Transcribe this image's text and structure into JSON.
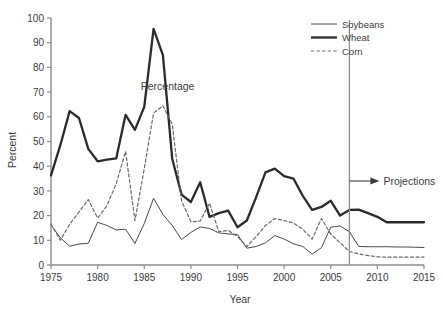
{
  "chart_data": {
    "type": "line",
    "title": "Percentage",
    "xlabel": "Year",
    "ylabel": "Percent",
    "xlim": [
      1975,
      2015
    ],
    "ylim": [
      0,
      100
    ],
    "xticks": [
      1975,
      1980,
      1985,
      1990,
      1995,
      2000,
      2005,
      2010,
      2015
    ],
    "yticks": [
      0,
      10,
      20,
      30,
      40,
      50,
      60,
      70,
      80,
      90,
      100
    ],
    "grid": false,
    "legend_position": "top-right",
    "legend": [
      "Soybeans",
      "Wheat",
      "Corn"
    ],
    "annotations": [
      {
        "text": "Percentage",
        "x": 1987.5,
        "y": 71
      },
      {
        "text": "Projections",
        "x": 2009.5,
        "y": 34
      }
    ],
    "projection_divider_year": 2007,
    "x": [
      1975,
      1976,
      1977,
      1978,
      1979,
      1980,
      1981,
      1982,
      1983,
      1984,
      1985,
      1986,
      1987,
      1988,
      1989,
      1990,
      1991,
      1992,
      1993,
      1994,
      1995,
      1996,
      1997,
      1998,
      1999,
      2000,
      2001,
      2002,
      2003,
      2004,
      2005,
      2006,
      2007,
      2008,
      2009,
      2010,
      2011,
      2012,
      2013,
      2014,
      2015
    ],
    "series": [
      {
        "name": "Soybeans",
        "style": "thin-solid",
        "color": "#4a4a4a",
        "values": [
          16.3,
          11.0,
          7.6,
          8.5,
          8.8,
          17.3,
          16.0,
          14.2,
          14.5,
          8.7,
          16.8,
          27.0,
          20.5,
          16.0,
          10.3,
          13.2,
          15.4,
          14.8,
          13.0,
          12.6,
          12.3,
          6.8,
          7.5,
          9.0,
          11.9,
          10.5,
          8.6,
          7.5,
          4.4,
          7.0,
          15.3,
          15.8,
          13.5,
          7.5,
          7.4,
          7.4,
          7.4,
          7.3,
          7.3,
          7.2,
          7.1
        ]
      },
      {
        "name": "Wheat",
        "style": "thick-solid",
        "color": "#2b2b2b",
        "values": [
          36.3,
          48.5,
          62.3,
          59.5,
          47.0,
          42.0,
          42.7,
          43.2,
          60.8,
          54.7,
          64.0,
          95.6,
          85.0,
          43.0,
          28.5,
          25.5,
          33.5,
          19.5,
          21.0,
          22.0,
          15.3,
          18.0,
          27.5,
          37.5,
          39.0,
          36.0,
          35.0,
          28.0,
          22.3,
          23.5,
          26.0,
          20.0,
          22.3,
          22.4,
          21.0,
          19.5,
          17.3,
          17.3,
          17.3,
          17.3,
          17.3
        ]
      },
      {
        "name": "Corn",
        "style": "dashed",
        "color": "#6a6a6a",
        "values": [
          16.6,
          10.0,
          16.5,
          21.5,
          26.5,
          19.0,
          24.0,
          33.0,
          46.0,
          18.0,
          39.0,
          61.5,
          64.5,
          57.0,
          26.0,
          17.5,
          17.8,
          25.0,
          13.5,
          14.0,
          11.5,
          7.5,
          11.5,
          16.0,
          18.8,
          18.0,
          17.0,
          14.5,
          10.5,
          18.8,
          12.5,
          9.0,
          5.5,
          4.5,
          3.8,
          3.3,
          3.2,
          3.2,
          3.2,
          3.2,
          3.2
        ]
      }
    ]
  }
}
